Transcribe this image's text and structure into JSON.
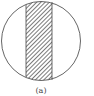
{
  "figure": {
    "label": "(a)",
    "stroke_color": "#555555",
    "hatch_color": "#333333",
    "background": "#ffffff"
  }
}
